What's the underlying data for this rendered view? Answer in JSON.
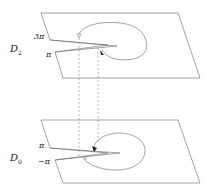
{
  "diagram": {
    "upper_sheet": {
      "label": "D",
      "label_sub": "2",
      "cut_upper_label": "3π",
      "cut_lower_label": "π"
    },
    "lower_sheet": {
      "label": "D",
      "label_sub": "0",
      "cut_upper_label": "π",
      "cut_lower_label": "−π"
    },
    "connectors": {
      "style": "dashed",
      "count": 2
    },
    "colors": {
      "stroke": "#555555",
      "dashed": "#888888",
      "background": "#ffffff"
    }
  }
}
